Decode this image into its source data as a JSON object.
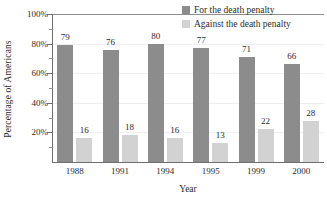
{
  "chart_data": {
    "type": "bar",
    "title": "",
    "xlabel": "Year",
    "ylabel": "Percentage of Americans",
    "categories": [
      "1988",
      "1991",
      "1994",
      "1995",
      "1999",
      "2000"
    ],
    "series": [
      {
        "name": "For the death penalty",
        "color": "#8c8c8c",
        "values": [
          79,
          76,
          80,
          77,
          71,
          66
        ]
      },
      {
        "name": "Against the death penalty",
        "color": "#d2d2d2",
        "values": [
          16,
          18,
          16,
          13,
          22,
          28
        ]
      }
    ],
    "ylim": [
      0,
      100
    ],
    "y_major_ticks": [
      20,
      40,
      60,
      80,
      100
    ],
    "y_tick_labels": [
      "20%",
      "40%",
      "60%",
      "80%",
      "100%"
    ],
    "y_minor_ticks": [
      10,
      30,
      50,
      70,
      90
    ],
    "grid": true,
    "legend_position": "top-right",
    "data_labels": true
  },
  "axes": {
    "y_title": "Percentage of Americans",
    "x_title": "Year"
  },
  "legend": {
    "entries": [
      {
        "label": "For the death penalty",
        "swatch": "for"
      },
      {
        "label": "Against the death penalty",
        "swatch": "against"
      }
    ]
  }
}
